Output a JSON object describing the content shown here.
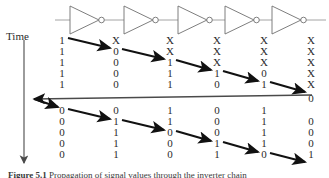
{
  "figure": {
    "axis_label": "Time",
    "caption_prefix": "Figure 5.1",
    "caption_text": "Propagation of signal values through the inverter chain",
    "gate_count": 5,
    "gate_type": "inverter",
    "column_count": 6,
    "colors": {
      "wire": "#9a9a9a",
      "gate_outline": "#6f6f6f",
      "text": "#2b2b2b",
      "arrow": "#111111",
      "feedback_line": "#4a4a4a"
    }
  },
  "columns_x": [
    62,
    116,
    170,
    217,
    264,
    311
  ],
  "upper_block": {
    "rows_y": [
      40,
      51,
      62,
      73,
      84
    ],
    "rows": [
      [
        "1",
        "X",
        "X",
        "X",
        "X",
        "X"
      ],
      [
        "1",
        "0",
        "X",
        "X",
        "X",
        "X"
      ],
      [
        "1",
        "0",
        "1",
        "X",
        "X",
        "X"
      ],
      [
        "1",
        "0",
        "1",
        "1",
        "0",
        "X"
      ],
      [
        "1",
        "0",
        "1",
        "0",
        "1",
        "X"
      ]
    ],
    "arrows": [
      {
        "from_col": 0,
        "to_col": 1,
        "row": 0
      },
      {
        "from_col": 1,
        "to_col": 2,
        "row": 1
      },
      {
        "from_col": 2,
        "to_col": 3,
        "row": 2
      },
      {
        "from_col": 3,
        "to_col": 4,
        "row": 3
      },
      {
        "from_col": 4,
        "to_col": 5,
        "row": 4
      }
    ]
  },
  "feedback": {
    "y": 97,
    "value": "0",
    "value_col": 5
  },
  "lower_block": {
    "rows_y": [
      110,
      121,
      132,
      143,
      154
    ],
    "rows": [
      [
        "0",
        "0",
        "1",
        "0",
        "1",
        ""
      ],
      [
        "0",
        "1",
        "1",
        "0",
        "1",
        "0"
      ],
      [
        "0",
        "1",
        "0",
        "0",
        "1",
        "0"
      ],
      [
        "0",
        "1",
        "0",
        "1",
        "1",
        "0"
      ],
      [
        "0",
        "1",
        "0",
        "1",
        "0",
        "1"
      ]
    ],
    "arrows": [
      {
        "from_col": 0,
        "to_col": 1,
        "row": 0
      },
      {
        "from_col": 1,
        "to_col": 2,
        "row": 1
      },
      {
        "from_col": 2,
        "to_col": 3,
        "row": 2
      },
      {
        "from_col": 3,
        "to_col": 4,
        "row": 3
      },
      {
        "from_col": 4,
        "to_col": 5,
        "row": 4
      }
    ]
  },
  "gates": [
    {
      "x": 70
    },
    {
      "x": 124
    },
    {
      "x": 178
    },
    {
      "x": 225
    },
    {
      "x": 272
    }
  ]
}
